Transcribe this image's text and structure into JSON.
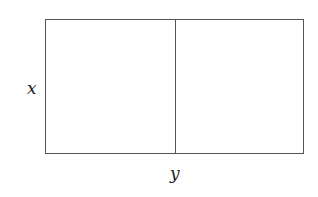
{
  "diagram": {
    "labels": {
      "side_label": "x",
      "bottom_label": "y"
    },
    "shapes": [
      {
        "type": "rectangle",
        "label_height": "x",
        "label_width": "y"
      },
      {
        "type": "vertical-divider",
        "position": "middle"
      }
    ]
  }
}
